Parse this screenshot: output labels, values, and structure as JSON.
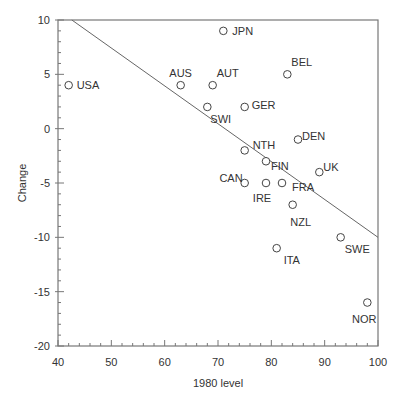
{
  "chart_data": {
    "type": "scatter",
    "title": "",
    "xlabel": "1980 level",
    "ylabel": "Change",
    "xlim": [
      40,
      100
    ],
    "ylim": [
      -20,
      10
    ],
    "xticks": [
      40,
      50,
      60,
      70,
      80,
      90,
      100
    ],
    "yticks": [
      10,
      5,
      0,
      -5,
      -10,
      -15,
      -20
    ],
    "grid": false,
    "legend": null,
    "points": [
      {
        "label": "USA",
        "x": 42,
        "y": 4
      },
      {
        "label": "JPN",
        "x": 71,
        "y": 9
      },
      {
        "label": "AUS",
        "x": 63,
        "y": 4
      },
      {
        "label": "AUT",
        "x": 69,
        "y": 4
      },
      {
        "label": "BEL",
        "x": 83,
        "y": 5
      },
      {
        "label": "SWI",
        "x": 68,
        "y": 2
      },
      {
        "label": "GER",
        "x": 75,
        "y": 2
      },
      {
        "label": "DEN",
        "x": 85,
        "y": -1
      },
      {
        "label": "NTH",
        "x": 75,
        "y": -2
      },
      {
        "label": "FIN",
        "x": 79,
        "y": -3
      },
      {
        "label": "UK",
        "x": 89,
        "y": -4
      },
      {
        "label": "CAN",
        "x": 75,
        "y": -5
      },
      {
        "label": "IRE",
        "x": 79,
        "y": -5
      },
      {
        "label": "FRA",
        "x": 82,
        "y": -5
      },
      {
        "label": "NZL",
        "x": 84,
        "y": -7
      },
      {
        "label": "SWE",
        "x": 93,
        "y": -10
      },
      {
        "label": "ITA",
        "x": 81,
        "y": -11
      },
      {
        "label": "NOR",
        "x": 98,
        "y": -16
      }
    ],
    "fit_line": {
      "x": [
        42.6,
        100
      ],
      "y": [
        10,
        -10
      ]
    }
  },
  "label_offsets": {
    "USA": [
      8,
      0,
      "start"
    ],
    "JPN": [
      9,
      0,
      "start"
    ],
    "AUS": [
      0,
      -12,
      "middle"
    ],
    "AUT": [
      4,
      -12,
      "start"
    ],
    "BEL": [
      4,
      -12,
      "start"
    ],
    "SWI": [
      3,
      12,
      "start"
    ],
    "GER": [
      7,
      -2,
      "start"
    ],
    "DEN": [
      4,
      -4,
      "start"
    ],
    "NTH": [
      8,
      -5,
      "start"
    ],
    "FIN": [
      5,
      5,
      "start"
    ],
    "UK": [
      4,
      -5,
      "start"
    ],
    "CAN": [
      -2,
      -5,
      "end"
    ],
    "IRE": [
      -4,
      15,
      "middle"
    ],
    "FRA": [
      10,
      4,
      "start"
    ],
    "NZL": [
      8,
      17,
      "middle"
    ],
    "SWE": [
      4,
      12,
      "start"
    ],
    "ITA": [
      7,
      12,
      "start"
    ],
    "NOR": [
      -3,
      16,
      "middle"
    ]
  }
}
